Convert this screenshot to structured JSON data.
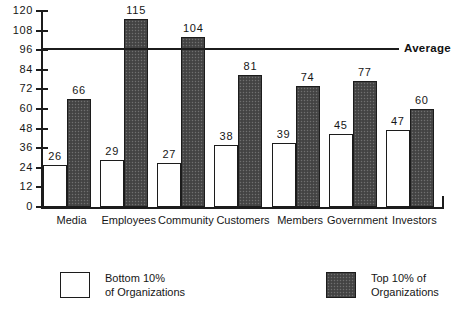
{
  "chart_data": {
    "type": "bar",
    "title": "",
    "xlabel": "",
    "ylabel": "",
    "ylim": [
      0,
      120
    ],
    "yticks": [
      0,
      12,
      24,
      36,
      48,
      60,
      72,
      84,
      96,
      108,
      120
    ],
    "grid": false,
    "legend_position": "bottom",
    "categories": [
      "Media",
      "Employees",
      "Community",
      "Customers",
      "Members",
      "Government",
      "Investors"
    ],
    "series": [
      {
        "name": "Bottom 10% of Organizations",
        "style": "light",
        "values": [
          26,
          29,
          27,
          38,
          39,
          45,
          47
        ]
      },
      {
        "name": "Top 10% of Organizations",
        "style": "dark",
        "values": [
          66,
          115,
          104,
          81,
          74,
          77,
          60
        ]
      }
    ],
    "annotations": [
      {
        "name": "average-line",
        "label": "Average",
        "value": 97,
        "orientation": "horizontal"
      }
    ]
  },
  "legend": {
    "entries": [
      {
        "label_line1": "Bottom  10%",
        "label_line2": "of Organizations",
        "style": "light"
      },
      {
        "label_line1": "Top 10% of",
        "label_line2": "Organizations",
        "style": "dark"
      }
    ]
  },
  "colors": {
    "axis": "#1c1c1c",
    "light_bar_fill": "#ffffff",
    "dark_bar_fill": "#4a4a4a",
    "text": "#161616",
    "background": "#ffffff"
  }
}
